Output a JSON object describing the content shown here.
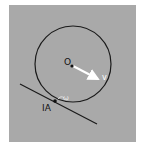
{
  "diagram": {
    "background_color": "#a9a9a9",
    "page_color": "#ffffff",
    "circle": {
      "cx": 73,
      "cy": 64,
      "r": 38,
      "stroke": "#1a1a1a"
    },
    "center": {
      "x": 72,
      "y": 66,
      "label": "O"
    },
    "velocity": {
      "x1": 72,
      "y1": 66,
      "x2": 100,
      "y2": 80,
      "color": "#ffffff",
      "label": "v"
    },
    "tangent_line": {
      "x1": 20,
      "y1": 84,
      "x2": 97,
      "y2": 124,
      "stroke": "#1a1a1a"
    },
    "contact_point": {
      "x": 55,
      "y": 101,
      "label": "IA"
    },
    "angular_velocity": {
      "label": "ω",
      "color": "#e8e8e8"
    }
  }
}
